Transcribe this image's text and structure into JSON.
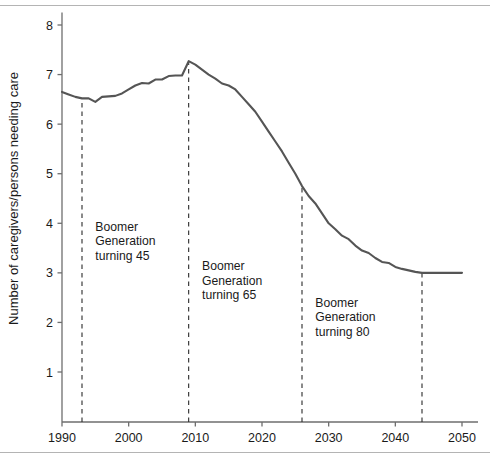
{
  "figure": {
    "background_color": "#ffffff",
    "rule_color": "#b4b4b4",
    "line_color": "#555555",
    "axis_color": "#6e6e6e",
    "marker_color": "#2b2b2b"
  },
  "chart_data": {
    "type": "line",
    "title": "",
    "xlabel": "",
    "ylabel": "Number of caregivers/persons needing care",
    "xlim": [
      1988,
      2052
    ],
    "ylim": [
      0.3,
      8.25
    ],
    "grid": false,
    "legend": "none",
    "xticks": [
      1990,
      2000,
      2010,
      2020,
      2030,
      2040,
      2050
    ],
    "xtick_labels": [
      "1990",
      "2000",
      "2010",
      "2020",
      "2030",
      "2040",
      "2050"
    ],
    "yticks": [
      1,
      2,
      3,
      4,
      5,
      6,
      7,
      8
    ],
    "ytick_labels": [
      "1",
      "2",
      "3",
      "4",
      "5",
      "6",
      "7",
      "8"
    ],
    "series": [
      {
        "name": "Caregiver support ratio",
        "color": "#555555",
        "x": [
          1990,
          1991,
          1992,
          1993,
          1994,
          1995,
          1996,
          1997,
          1998,
          1999,
          2000,
          2001,
          2002,
          2003,
          2004,
          2005,
          2006,
          2007,
          2008,
          2009,
          2010,
          2011,
          2012,
          2013,
          2014,
          2015,
          2016,
          2017,
          2018,
          2019,
          2020,
          2021,
          2022,
          2023,
          2024,
          2025,
          2026,
          2027,
          2028,
          2029,
          2030,
          2031,
          2032,
          2033,
          2034,
          2035,
          2036,
          2037,
          2038,
          2039,
          2040,
          2041,
          2042,
          2043,
          2044,
          2045,
          2046,
          2047,
          2048,
          2049,
          2050
        ],
        "y": [
          6.65,
          6.6,
          6.55,
          6.52,
          6.52,
          6.45,
          6.55,
          6.56,
          6.57,
          6.62,
          6.7,
          6.78,
          6.83,
          6.82,
          6.9,
          6.9,
          6.97,
          6.98,
          6.98,
          7.27,
          7.2,
          7.1,
          7.0,
          6.92,
          6.82,
          6.78,
          6.7,
          6.55,
          6.4,
          6.25,
          6.05,
          5.85,
          5.65,
          5.45,
          5.22,
          5.0,
          4.75,
          4.55,
          4.4,
          4.2,
          4.0,
          3.88,
          3.75,
          3.68,
          3.55,
          3.45,
          3.4,
          3.3,
          3.22,
          3.2,
          3.12,
          3.08,
          3.05,
          3.02,
          3.0,
          3.0,
          3.0,
          3.0,
          3.0,
          3.0,
          3.0
        ]
      }
    ],
    "annotations": [
      {
        "id": "boomer-45",
        "marker_x": 1993,
        "text_x": 1995,
        "text_y": 3.85,
        "lines": [
          "Boomer",
          "Generation",
          "turning 45"
        ]
      },
      {
        "id": "boomer-65",
        "marker_x": 2009,
        "text_x": 2011,
        "text_y": 3.05,
        "lines": [
          "Boomer",
          "Generation",
          "turning 65"
        ]
      },
      {
        "id": "boomer-80",
        "marker_x": 2026,
        "text_x": 2028,
        "text_y": 2.32,
        "lines": [
          "Boomer",
          "Generation",
          "turning 80"
        ]
      },
      {
        "id": "boomer-end",
        "marker_x": 2044,
        "text_x": null,
        "text_y": null,
        "lines": []
      }
    ]
  }
}
